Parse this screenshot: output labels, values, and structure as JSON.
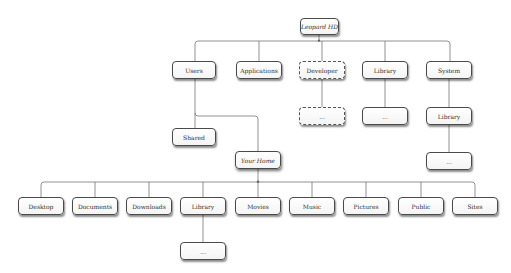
{
  "diagram": {
    "nodes": {
      "root": {
        "label": "Leopard HD",
        "x": 300,
        "y": 18,
        "w": 39,
        "h": 17,
        "style": "italic"
      },
      "users": {
        "label": "Users",
        "x": 172,
        "y": 61,
        "w": 44,
        "h": 18
      },
      "applications": {
        "label": "Applications",
        "x": 236,
        "y": 61,
        "w": 46,
        "h": 18
      },
      "developer": {
        "label": "Developer",
        "x": 299,
        "y": 61,
        "w": 46,
        "h": 18,
        "style": "dashed"
      },
      "library_root": {
        "label": "Library",
        "x": 362,
        "y": 61,
        "w": 46,
        "h": 18
      },
      "system": {
        "label": "System",
        "x": 426,
        "y": 61,
        "w": 46,
        "h": 18
      },
      "developer_more": {
        "label": "...",
        "x": 299,
        "y": 107,
        "w": 46,
        "h": 18,
        "style": "dashed"
      },
      "library_root_more": {
        "label": "...",
        "x": 362,
        "y": 107,
        "w": 46,
        "h": 18
      },
      "system_library": {
        "label": "Library",
        "x": 426,
        "y": 107,
        "w": 46,
        "h": 18
      },
      "system_library_more": {
        "label": "...",
        "x": 426,
        "y": 152,
        "w": 46,
        "h": 18
      },
      "shared": {
        "label": "Shared",
        "x": 172,
        "y": 128,
        "w": 44,
        "h": 18
      },
      "your_home": {
        "label": "Your Home",
        "x": 235,
        "y": 151,
        "w": 46,
        "h": 18,
        "style": "italic strong"
      },
      "desktop": {
        "label": "Desktop",
        "x": 18,
        "y": 197,
        "w": 46,
        "h": 18
      },
      "documents": {
        "label": "Documents",
        "x": 72,
        "y": 197,
        "w": 46,
        "h": 18
      },
      "downloads": {
        "label": "Downloads",
        "x": 126,
        "y": 197,
        "w": 46,
        "h": 18
      },
      "library_home": {
        "label": "Library",
        "x": 180,
        "y": 197,
        "w": 46,
        "h": 18
      },
      "movies": {
        "label": "Movies",
        "x": 235,
        "y": 197,
        "w": 46,
        "h": 18
      },
      "music": {
        "label": "Music",
        "x": 289,
        "y": 197,
        "w": 46,
        "h": 18
      },
      "pictures": {
        "label": "Pictures",
        "x": 343,
        "y": 197,
        "w": 46,
        "h": 18
      },
      "public": {
        "label": "Public",
        "x": 398,
        "y": 197,
        "w": 46,
        "h": 18
      },
      "sites": {
        "label": "Sites",
        "x": 452,
        "y": 197,
        "w": 46,
        "h": 18
      },
      "library_home_more": {
        "label": "...",
        "x": 180,
        "y": 242,
        "w": 46,
        "h": 18
      }
    },
    "edges": [
      [
        "root",
        "users"
      ],
      [
        "root",
        "applications"
      ],
      [
        "root",
        "developer"
      ],
      [
        "root",
        "library_root"
      ],
      [
        "root",
        "system"
      ],
      [
        "developer",
        "developer_more"
      ],
      [
        "library_root",
        "library_root_more"
      ],
      [
        "system",
        "system_library"
      ],
      [
        "system_library",
        "system_library_more"
      ],
      [
        "users",
        "shared"
      ],
      [
        "users",
        "your_home"
      ],
      [
        "your_home",
        "desktop"
      ],
      [
        "your_home",
        "documents"
      ],
      [
        "your_home",
        "downloads"
      ],
      [
        "your_home",
        "library_home"
      ],
      [
        "your_home",
        "movies"
      ],
      [
        "your_home",
        "music"
      ],
      [
        "your_home",
        "pictures"
      ],
      [
        "your_home",
        "public"
      ],
      [
        "your_home",
        "sites"
      ],
      [
        "library_home",
        "library_home_more"
      ]
    ],
    "colors": {
      "line": "#777777",
      "border": "#4a4a4a",
      "text": "#333333",
      "background": "#ffffff"
    }
  }
}
